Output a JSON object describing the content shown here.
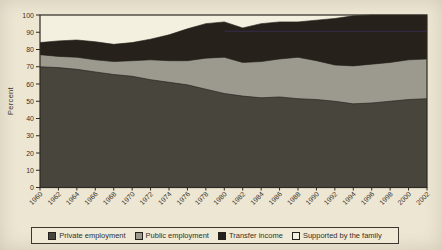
{
  "figure": {
    "background_color": "#ece6d3",
    "plot_background_color": "#f4f0e0",
    "axis_color": "#2e2a23",
    "text_color": "#39352c"
  },
  "chart_data": {
    "type": "area",
    "stacked": true,
    "title": "",
    "xlabel": "",
    "ylabel": "Percent",
    "ylim": [
      0,
      100
    ],
    "yticks": [
      0,
      10,
      20,
      30,
      40,
      50,
      60,
      70,
      80,
      90,
      100
    ],
    "grid": false,
    "legend_position": "bottom",
    "categories": [
      "1960",
      "1962",
      "1964",
      "1966",
      "1968",
      "1970",
      "1972",
      "1974",
      "1976",
      "1978",
      "1980",
      "1982",
      "1984",
      "1986",
      "1988",
      "1990",
      "1992",
      "1994",
      "1996",
      "1998",
      "2000",
      "2002"
    ],
    "series": [
      {
        "name": "Private employment",
        "color": "#48453d",
        "values": [
          70,
          69.5,
          68.5,
          67,
          65.5,
          64.5,
          62.5,
          61,
          59.5,
          57,
          54.5,
          53,
          52,
          52.5,
          51.5,
          51,
          50,
          48.5,
          49,
          50,
          51,
          51.5
        ]
      },
      {
        "name": "Public employment",
        "color": "#9c998f",
        "values": [
          7,
          6.5,
          7,
          7,
          7.5,
          9,
          11.5,
          12.5,
          14,
          18,
          21,
          19.5,
          21,
          22,
          24,
          22.5,
          21,
          22,
          22.5,
          22.5,
          23,
          23
        ]
      },
      {
        "name": "Transfer income",
        "color": "#26221b",
        "values": [
          7,
          9,
          10,
          10.5,
          10,
          10.5,
          12,
          15,
          18.5,
          20,
          20.5,
          20,
          22,
          21.5,
          20.5,
          23.5,
          27,
          29,
          28.5,
          27.5,
          26,
          25.5
        ]
      },
      {
        "name": "Supported by the family",
        "color": "#f4f0e0",
        "values": [
          16,
          15,
          14.5,
          15.5,
          17,
          16,
          14,
          11.5,
          8,
          5,
          4,
          7.5,
          5,
          4,
          4,
          3,
          2,
          0.5,
          0,
          0,
          0,
          0
        ]
      }
    ],
    "scan_artifact_line": {
      "color": "#3c2f5e",
      "y_value": 90.5,
      "start_category": "1980"
    }
  }
}
